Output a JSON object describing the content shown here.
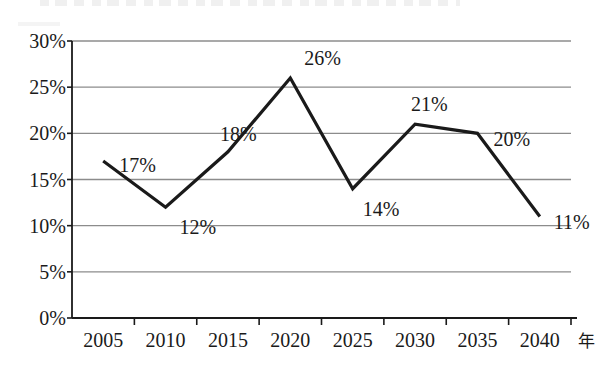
{
  "chart_data": {
    "type": "line",
    "title": "",
    "xlabel": "年",
    "ylabel": "",
    "categories": [
      "2005",
      "2010",
      "2015",
      "2020",
      "2025",
      "2030",
      "2035",
      "2040"
    ],
    "values": [
      17,
      12,
      18,
      26,
      14,
      21,
      20,
      11
    ],
    "point_labels": [
      "17%",
      "12%",
      "18%",
      "26%",
      "14%",
      "21%",
      "20%",
      "11%"
    ],
    "ylim": [
      0,
      30
    ],
    "ytick_values": [
      0,
      5,
      10,
      15,
      20,
      25,
      30
    ],
    "ytick_labels": [
      "0%",
      "5%",
      "10%",
      "15%",
      "20%",
      "25%",
      "30%"
    ],
    "grid": true,
    "legend": "none",
    "series_name": "",
    "colors": {
      "line": "#1a1a1a",
      "grid": "#8c8c8c",
      "axis": "#1a1a1a",
      "text": "#1a1a1a",
      "background": "#ffffff"
    }
  },
  "axis": {
    "unit_label": "年"
  }
}
